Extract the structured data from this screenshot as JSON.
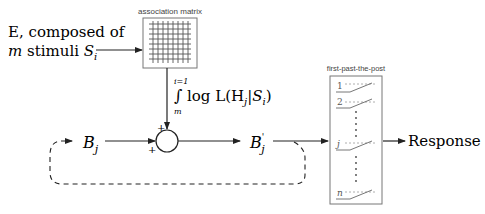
{
  "input": {
    "line1": "E, composed of",
    "line2_m": "m",
    "line2_text": " stimuli ",
    "line2_S": "S",
    "line2_sub": "i"
  },
  "matrix": {
    "label": "association matrix",
    "rows": 8,
    "cols": 8
  },
  "integral": {
    "upper": "i=1",
    "lower": "m",
    "symbol": "∫",
    "expr_prefix": "log L(H",
    "expr_sub_j": "j",
    "expr_bar": "|",
    "expr_S": "S",
    "expr_sub_i": "i",
    "expr_close": ")"
  },
  "summation": {
    "plus_top": "+",
    "plus_left": "+"
  },
  "belief_in": {
    "symbol": "B",
    "sub": "j"
  },
  "belief_out": {
    "symbol": "B",
    "prime": "'",
    "sub": "j"
  },
  "fptp": {
    "label": "first-past-the-post",
    "accumulators": [
      "1",
      "2",
      "j",
      "n"
    ]
  },
  "output": {
    "label": "Response"
  },
  "colors": {
    "line": "#222222",
    "gray": "#888888",
    "box": "#666666"
  }
}
